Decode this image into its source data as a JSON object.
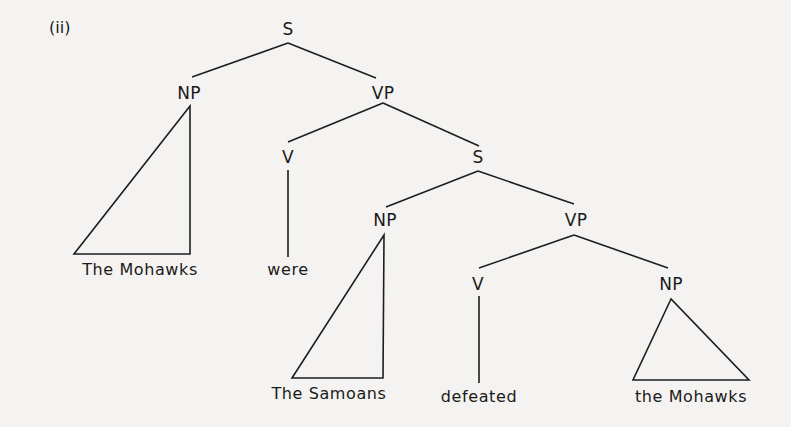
{
  "figure_label": "(ii)",
  "tree": {
    "root": {
      "label": "S",
      "np": {
        "label": "NP",
        "leaf": "The Mohawks",
        "shape": "triangle"
      },
      "vp": {
        "label": "VP",
        "v": {
          "label": "V",
          "leaf": "were"
        },
        "s": {
          "label": "S",
          "np": {
            "label": "NP",
            "leaf": "The Samoans",
            "shape": "triangle"
          },
          "vp": {
            "label": "VP",
            "v": {
              "label": "V",
              "leaf": "defeated"
            },
            "np": {
              "label": "NP",
              "leaf": "the Mohawks",
              "shape": "triangle"
            }
          }
        }
      }
    }
  },
  "colors": {
    "ink": "#1e1e1e",
    "paper": "#f4f3f1"
  }
}
